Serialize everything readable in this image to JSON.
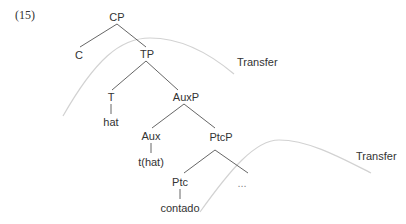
{
  "example_number": "(15)",
  "tree": {
    "nodes": {
      "cp": "CP",
      "c": "C",
      "tp": "TP",
      "t": "T",
      "t_word": "hat",
      "auxp": "AuxP",
      "aux": "Aux",
      "aux_word": "t(hat)",
      "ptcp": "PtcP",
      "ptc": "Ptc",
      "ptc_word": "contado",
      "ellipsis": "..."
    }
  },
  "annotations": {
    "transfer_upper": "Transfer",
    "transfer_lower": "Transfer"
  },
  "colors": {
    "tree_line": "#555555",
    "transfer_curve": "#cfcfcf",
    "text": "#333333"
  }
}
